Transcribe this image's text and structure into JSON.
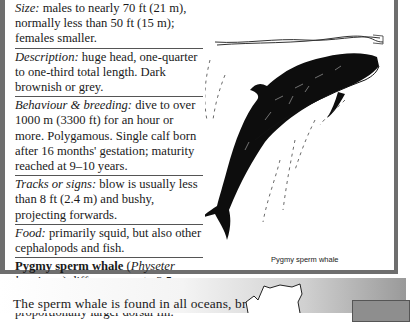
{
  "facts": [
    {
      "label": "Size:",
      "text": " males to nearly 70 ft (21 m), normally less than 50 ft (15 m); females smaller."
    },
    {
      "label": "Description:",
      "text": " huge head, one-quarter to one-third total length. Dark brownish or grey."
    },
    {
      "label": "Behaviour & breeding:",
      "text": " dive to over 1000 m (3300 ft) for an hour or more. Polygamous. Single calf born after 16 months' gestation; maturity reached at 9–10 years."
    },
    {
      "label": "Tracks or signs:",
      "text": " blow is usually less than 8 ft (2.4 m) and bushy, projecting forwards."
    },
    {
      "label": "Food:",
      "text": " primarily squid, but also other cephalopods and fish."
    }
  ],
  "pygmy": {
    "name": "Pygmy sperm whale",
    "open_paren": " (",
    "latin": "Physeter breviceps",
    "text": ") differs: grows to 3.5 m (11½ ft); smaller head; proportionally larger dorsal fin."
  },
  "illustration": {
    "caption": "Pygmy sperm whale"
  },
  "body_text": "The sperm whale is found in all oceans, breed-"
}
